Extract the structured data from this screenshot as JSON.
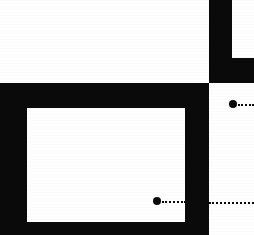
{
  "figure": {
    "width": 254,
    "height": 235,
    "background_color": "#ffffff",
    "ink_color": "#0a0a0a"
  },
  "shapes": [
    {
      "name": "top-right-vertical-bar",
      "kind": "rectangle",
      "fill": "#0a0a0a",
      "x": 209,
      "y": 0,
      "width": 23,
      "height": 83
    },
    {
      "name": "top-right-horizontal-extension",
      "kind": "rectangle",
      "fill": "#0a0a0a",
      "x": 232,
      "y": 58,
      "width": 22,
      "height": 25
    },
    {
      "name": "main-black-frame-block",
      "kind": "rectangle",
      "fill": "#0a0a0a",
      "x": 0,
      "y": 83,
      "width": 209,
      "height": 152
    },
    {
      "name": "main-frame-inner-white-field",
      "kind": "rectangle",
      "fill": "#ffffff",
      "x": 27,
      "y": 108,
      "width": 158,
      "height": 114
    }
  ],
  "markers": [
    {
      "name": "inner-field-callout-dot",
      "cx": 157,
      "cy": 201,
      "radius": 4,
      "fill": "#0a0a0a",
      "leader": {
        "x": 162,
        "y": 201,
        "length": 24,
        "style": "dotted",
        "thickness": 2
      }
    },
    {
      "name": "right-panel-callout-dot",
      "cx": 233,
      "cy": 104,
      "radius": 4,
      "fill": "#0a0a0a",
      "leader": {
        "x": 238,
        "y": 104,
        "length": 16,
        "style": "dotted",
        "thickness": 2
      }
    }
  ],
  "guides": [
    {
      "name": "right-panel-dotted-rule",
      "x": 209,
      "y": 202,
      "length": 45,
      "style": "dotted",
      "thickness": 2,
      "color": "#0a0a0a"
    }
  ]
}
